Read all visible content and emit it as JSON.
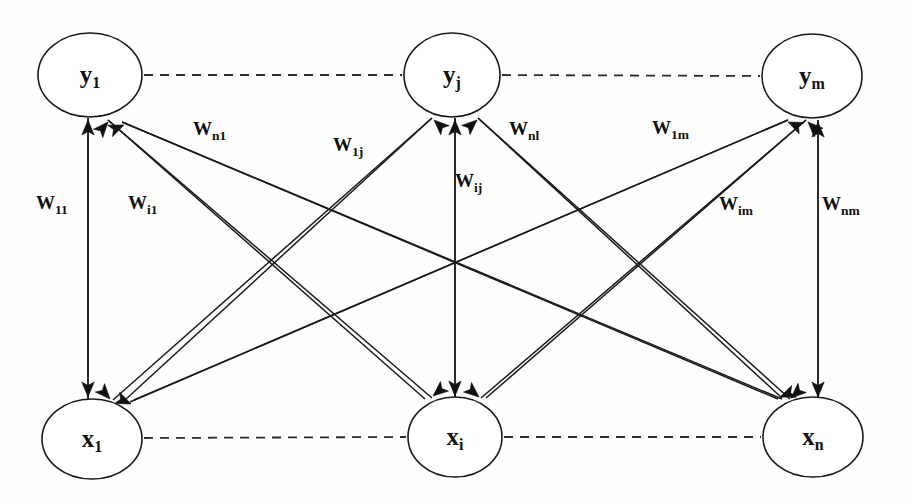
{
  "figure": {
    "background_color": "#fefefe",
    "stroke_color": "#1a1a1a"
  },
  "nodes": {
    "output_layer": [
      {
        "id": "y1",
        "base": "y",
        "sub": "1",
        "cx": 90,
        "cy": 75,
        "rx": 52,
        "ry": 42
      },
      {
        "id": "yj",
        "base": "y",
        "sub": "j",
        "cx": 452,
        "cy": 75,
        "rx": 48,
        "ry": 42
      },
      {
        "id": "ym",
        "base": "y",
        "sub": "m",
        "cx": 812,
        "cy": 76,
        "rx": 50,
        "ry": 42
      }
    ],
    "input_layer": [
      {
        "id": "x1",
        "base": "x",
        "sub": "1",
        "cx": 92,
        "cy": 439,
        "rx": 50,
        "ry": 40
      },
      {
        "id": "xi",
        "base": "x",
        "sub": "i",
        "cx": 455,
        "cy": 437,
        "rx": 47,
        "ry": 40
      },
      {
        "id": "xn",
        "base": "x",
        "sub": "n",
        "cx": 813,
        "cy": 437,
        "rx": 50,
        "ry": 40
      }
    ]
  },
  "dashed_connectors": [
    {
      "name": "y1-to-yj",
      "x1": 144,
      "y1": 75,
      "x2": 402,
      "y2": 75
    },
    {
      "name": "yj-to-ym",
      "x1": 502,
      "y1": 75,
      "x2": 760,
      "y2": 76
    },
    {
      "name": "x1-to-xi",
      "x1": 144,
      "y1": 438,
      "x2": 406,
      "y2": 437
    },
    {
      "name": "xi-to-xn",
      "x1": 504,
      "y1": 437,
      "x2": 761,
      "y2": 437
    }
  ],
  "weights": [
    {
      "id": "w11",
      "base": "W",
      "sub": "11",
      "x": 36,
      "y": 205,
      "from": "x1",
      "to": "y1"
    },
    {
      "id": "wi1",
      "base": "W",
      "sub": "i1",
      "x": 128,
      "y": 205,
      "from": "xi",
      "to": "y1"
    },
    {
      "id": "wn1",
      "base": "W",
      "sub": "n1",
      "x": 193,
      "y": 131,
      "from": "xn",
      "to": "y1"
    },
    {
      "id": "w1j",
      "base": "W",
      "sub": "1j",
      "x": 333,
      "y": 147,
      "from": "x1",
      "to": "yj"
    },
    {
      "id": "wij",
      "base": "W",
      "sub": "ij",
      "x": 455,
      "y": 183,
      "from": "xi",
      "to": "yj"
    },
    {
      "id": "wnj",
      "base": "W",
      "sub": "nl",
      "x": 509,
      "y": 131,
      "from": "xn",
      "to": "yj"
    },
    {
      "id": "w1m",
      "base": "W",
      "sub": "1m",
      "x": 652,
      "y": 130,
      "from": "x1",
      "to": "ym"
    },
    {
      "id": "wim",
      "base": "W",
      "sub": "im",
      "x": 719,
      "y": 206,
      "from": "xi",
      "to": "ym"
    },
    {
      "id": "wnm",
      "base": "W",
      "sub": "nm",
      "x": 822,
      "y": 206,
      "from": "xn",
      "to": "ym"
    }
  ],
  "edges": [
    {
      "name": "x1-y1",
      "x1": 88,
      "y1": 400,
      "x2": 88,
      "y2": 118
    },
    {
      "name": "xi-y1",
      "x1": 425,
      "y1": 399,
      "x2": 108,
      "y2": 120
    },
    {
      "name": "xn-y1",
      "x1": 778,
      "y1": 399,
      "x2": 122,
      "y2": 122
    },
    {
      "name": "x1-yj",
      "x1": 125,
      "y1": 400,
      "x2": 432,
      "y2": 118
    },
    {
      "name": "xi-yj",
      "x1": 455,
      "y1": 398,
      "x2": 455,
      "y2": 118
    },
    {
      "name": "xn-yj",
      "x1": 782,
      "y1": 398,
      "x2": 478,
      "y2": 118
    },
    {
      "name": "x1-ym",
      "x1": 134,
      "y1": 400,
      "x2": 788,
      "y2": 120
    },
    {
      "name": "xi-ym",
      "x1": 486,
      "y1": 398,
      "x2": 806,
      "y2": 120
    },
    {
      "name": "xn-ym",
      "x1": 818,
      "y1": 400,
      "x2": 818,
      "y2": 120
    }
  ],
  "edges_down": [
    {
      "name": "y1-x1",
      "x1": 88,
      "y1": 118,
      "x2": 88,
      "y2": 400
    },
    {
      "name": "yj-x1",
      "x1": 432,
      "y1": 118,
      "x2": 113,
      "y2": 400
    },
    {
      "name": "ym-x1",
      "x1": 788,
      "y1": 120,
      "x2": 130,
      "y2": 402
    },
    {
      "name": "y1-xi",
      "x1": 108,
      "y1": 120,
      "x2": 432,
      "y2": 398
    },
    {
      "name": "yj-xi",
      "x1": 455,
      "y1": 118,
      "x2": 455,
      "y2": 398
    },
    {
      "name": "ym-xi",
      "x1": 806,
      "y1": 120,
      "x2": 481,
      "y2": 398
    },
    {
      "name": "y1-xn",
      "x1": 122,
      "y1": 122,
      "x2": 782,
      "y2": 399
    },
    {
      "name": "yj-xn",
      "x1": 478,
      "y1": 118,
      "x2": 790,
      "y2": 399
    },
    {
      "name": "ym-xn",
      "x1": 818,
      "y1": 120,
      "x2": 818,
      "y2": 400
    }
  ],
  "arrowheads_top": [
    {
      "name": "head-y1-a",
      "x": 88,
      "y": 120,
      "angle": 270
    },
    {
      "name": "head-y1-b",
      "x": 108,
      "y": 122,
      "angle": 229
    },
    {
      "name": "head-y1-c",
      "x": 124,
      "y": 125,
      "angle": 203
    },
    {
      "name": "head-yj-a",
      "x": 434,
      "y": 120,
      "angle": 317
    },
    {
      "name": "head-yj-b",
      "x": 455,
      "y": 120,
      "angle": 270
    },
    {
      "name": "head-yj-c",
      "x": 477,
      "y": 120,
      "angle": 222
    },
    {
      "name": "head-ym-a",
      "x": 788,
      "y": 122,
      "angle": 336
    },
    {
      "name": "head-ym-b",
      "x": 808,
      "y": 122,
      "angle": 315
    },
    {
      "name": "head-ym-c",
      "x": 818,
      "y": 122,
      "angle": 270
    }
  ],
  "arrowheads_bottom": [
    {
      "name": "head-x1-a",
      "x": 88,
      "y": 397,
      "angle": 90
    },
    {
      "name": "head-x1-b",
      "x": 110,
      "y": 399,
      "angle": 132
    },
    {
      "name": "head-x1-c",
      "x": 131,
      "y": 404,
      "angle": 156
    },
    {
      "name": "head-xi-a",
      "x": 433,
      "y": 396,
      "angle": 40
    },
    {
      "name": "head-xi-b",
      "x": 455,
      "y": 396,
      "angle": 90
    },
    {
      "name": "head-xi-c",
      "x": 479,
      "y": 397,
      "angle": 140
    },
    {
      "name": "head-xn-a",
      "x": 780,
      "y": 397,
      "angle": 22
    },
    {
      "name": "head-xn-b",
      "x": 791,
      "y": 398,
      "angle": 42
    },
    {
      "name": "head-xn-c",
      "x": 818,
      "y": 397,
      "angle": 90
    }
  ]
}
